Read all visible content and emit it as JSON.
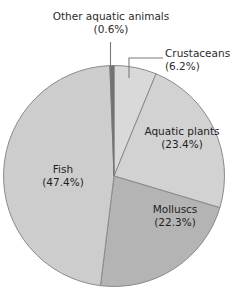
{
  "chart_data": {
    "type": "pie",
    "title": "",
    "subtitle": "",
    "xlabel": "",
    "ylabel": "",
    "legend_position": "none",
    "grid": false,
    "units": "percent",
    "start_angle_deg": 0,
    "direction": "clockwise",
    "categories": [
      "Crustaceans",
      "Aquatic plants",
      "Molluscs",
      "Fish",
      "Other aquatic animals"
    ],
    "values": [
      6.2,
      23.4,
      22.3,
      47.4,
      0.6
    ],
    "slices": [
      {
        "name": "Crustaceans",
        "label": "Crustaceans",
        "percent_label": "(6.2%)",
        "value": 6.2,
        "color": "#d9d9d9",
        "label_placement": "callout",
        "leader": "elbow"
      },
      {
        "name": "Aquatic plants",
        "label": "Aquatic plants",
        "percent_label": "(23.4%)",
        "value": 23.4,
        "color": "#d2d2d2",
        "label_placement": "inside",
        "leader": "none"
      },
      {
        "name": "Molluscs",
        "label": "Molluscs",
        "percent_label": "(22.3%)",
        "value": 22.3,
        "color": "#b4b4b4",
        "label_placement": "inside",
        "leader": "none"
      },
      {
        "name": "Fish",
        "label": "Fish",
        "percent_label": "(47.4%)",
        "value": 47.4,
        "color": "#cdcdcd",
        "label_placement": "inside",
        "leader": "none"
      },
      {
        "name": "Other aquatic animals",
        "label": "Other aquatic animals",
        "percent_label": "(0.6%)",
        "value": 0.6,
        "color": "#737373",
        "label_placement": "callout",
        "leader": "vertical"
      }
    ],
    "outline_color": "#8a8a8a",
    "background_color": "#ffffff",
    "text_color": "#1f1f1f"
  }
}
